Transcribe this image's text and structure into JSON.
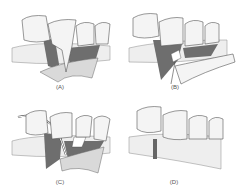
{
  "figure": {
    "panels": [
      {
        "id": "A",
        "label": "(A)"
      },
      {
        "id": "B",
        "label": "(B)"
      },
      {
        "id": "C",
        "label": "(C)"
      },
      {
        "id": "D",
        "label": "(D)"
      }
    ]
  },
  "colors": {
    "tooth_fill": "#f4f4f4",
    "outline": "#555555",
    "gum_dark": "#6e6e6e",
    "flap_light": "#d9d9d9"
  }
}
